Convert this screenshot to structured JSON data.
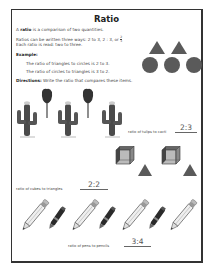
{
  "worksheet": {
    "title": "Ratio",
    "definition": {
      "prefix": "A ",
      "term": "ratio",
      "suffix": " is a comparison of two quantities."
    },
    "ways_line1": "Ratios can be written three ways: 2 to 3, 2 : 3, or",
    "ways_fraction": {
      "numerator": "2",
      "denominator": "3"
    },
    "ways_line2": "Each ratio is read: two to three.",
    "example_label": "Example:",
    "example_lines": [
      "The ratio of triangles to circles is 2 to 3.",
      "The ratio of circles to triangles is 3 to 2."
    ],
    "example_shapes": {
      "triangles": 2,
      "circles": 3
    },
    "directions": {
      "label": "Directions:",
      "text": " Write the ratio that compares these items."
    },
    "problems": [
      {
        "prompt": "ratio of tulips to cacti",
        "answer": "2:3",
        "items": [
          "cactus",
          "tulip",
          "cactus",
          "tulip",
          "cactus"
        ]
      },
      {
        "prompt": "ratio of cubes to triangles",
        "answer": "2:2",
        "items": [
          "cube",
          "cube",
          "triangle",
          "triangle"
        ]
      },
      {
        "prompt": "ratio of pens to pencils",
        "answer": "3:4",
        "items": [
          "pencil",
          "pen",
          "pencil",
          "pen",
          "pencil",
          "pen",
          "pencil"
        ]
      }
    ]
  },
  "colors": {
    "shape_fill": "#5a5a5a",
    "border": "#333333",
    "text": "#444444"
  }
}
